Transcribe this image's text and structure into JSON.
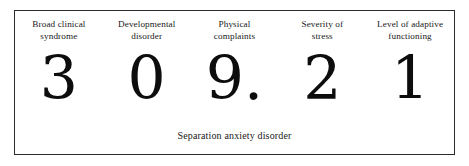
{
  "figure": {
    "border_color": "#2b2b2b",
    "background_color": "#ffffff",
    "text_color": "#202020",
    "digit_color": "#0d0d0d",
    "caption": "Separation anxiety disorder",
    "columns": [
      {
        "header": "Broad clinical\nsyndrome",
        "value": "3"
      },
      {
        "header": "Developmental\ndisorder",
        "value": "0"
      },
      {
        "header": "Physical\ncomplaints",
        "value": "9."
      },
      {
        "header": "Severity of\nstress",
        "value": "2"
      },
      {
        "header": "Level of adaptive\nfunctioning",
        "value": "1"
      }
    ]
  }
}
